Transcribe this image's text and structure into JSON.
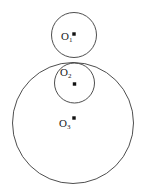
{
  "figure": {
    "background_color": "#ffffff",
    "stroke_color": "#3a3a3a",
    "dot_color": "#111111",
    "width": 146,
    "height": 196
  },
  "labels": {
    "o1": "O",
    "o1_sub": "1",
    "o2": "O",
    "o2_sub": "2",
    "o3": "O",
    "o3_sub": "3"
  },
  "chart_data": {
    "type": "scatter",
    "xlabel": "",
    "ylabel": "",
    "xlim": [
      0,
      146
    ],
    "ylim": [
      196,
      0
    ],
    "grid": false,
    "legend": "none",
    "shapes": [
      {
        "name": "circle-o1",
        "kind": "circle",
        "cx": 74,
        "cy": 35,
        "r": 22.5,
        "label": "O1",
        "fill": "none",
        "stroke": "#3a3a3a"
      },
      {
        "name": "circle-o2",
        "kind": "circle",
        "cx": 74.5,
        "cy": 83,
        "r": 20,
        "label": "O2",
        "fill": "none",
        "stroke": "#3a3a3a"
      },
      {
        "name": "circle-o3",
        "kind": "circle",
        "cx": 73,
        "cy": 123,
        "r": 60.5,
        "label": "O3",
        "fill": "none",
        "stroke": "#3a3a3a"
      }
    ],
    "points": [
      {
        "name": "center-o1",
        "x": 74,
        "y": 34,
        "label": "O1",
        "r": 1.8
      },
      {
        "name": "center-o2",
        "x": 74.5,
        "y": 84,
        "label": "O2",
        "r": 1.8
      },
      {
        "name": "center-o3",
        "x": 74,
        "y": 118,
        "label": "O3",
        "r": 1.8
      }
    ],
    "annotations": [
      {
        "name": "label-o1",
        "text": "O1",
        "x": 64,
        "y": 41
      },
      {
        "name": "label-o2",
        "text": "O2",
        "x": 63,
        "y": 76
      },
      {
        "name": "label-o3",
        "text": "O3",
        "x": 62,
        "y": 126
      }
    ]
  }
}
